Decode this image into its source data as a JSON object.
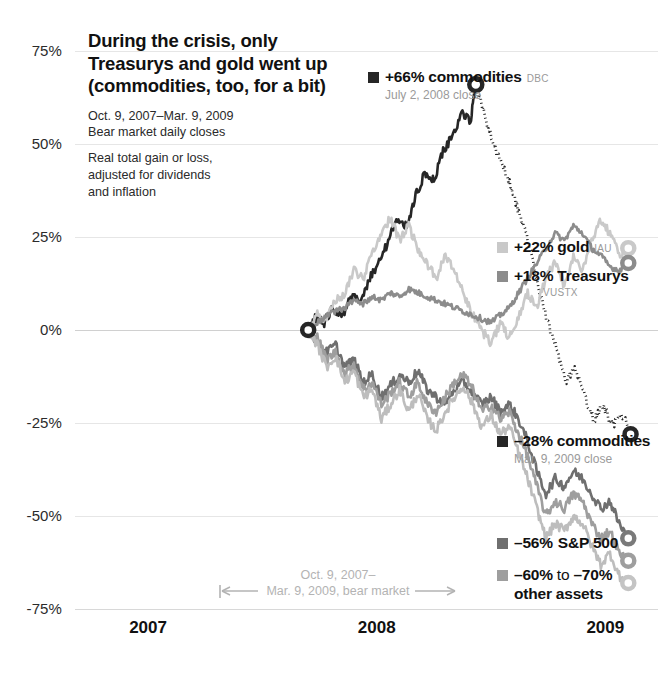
{
  "headline": {
    "title": "During the crisis, only Treasurys and gold went up (commodities, too, for a bit)",
    "subtitle_1_line_1": "Oct. 9, 2007–Mar. 9, 2009",
    "subtitle_1_line_2": "Bear market daily closes",
    "subtitle_2_line_1": "Real total gain or loss,",
    "subtitle_2_line_2": "adjusted for dividends",
    "subtitle_2_line_3": "and inflation"
  },
  "annotations": {
    "commodities_peak": {
      "value": "+66%",
      "name": "commodities",
      "ticker": "DBC",
      "note": "July 2, 2008 close",
      "color": "#262626"
    },
    "gold": {
      "value": "+22%",
      "name": "gold",
      "ticker": "IAU",
      "color": "#c9c9c9"
    },
    "treasurys": {
      "value": "+18%",
      "name": "Treasurys",
      "ticker": "VUSTX",
      "color": "#8c8c8c"
    },
    "commodities_end": {
      "value": "–28%",
      "name": "commodities",
      "note": "Mar. 9, 2009 close",
      "color": "#262626"
    },
    "sp500": {
      "value": "–56%",
      "name": "S&P 500",
      "color": "#6f6f6f"
    },
    "other_assets": {
      "value": "–60%",
      "connector": "to",
      "value2": "–70%",
      "name": "other assets",
      "color": "#9e9e9e"
    },
    "bear_market": {
      "line1": "Oct. 9, 2007–",
      "line2": "Mar. 9, 2009, bear market",
      "color": "#b3b3b3"
    }
  },
  "chart_data": {
    "type": "line",
    "title": "During the crisis, only Treasurys and gold went up (commodities, too, for a bit)",
    "subtitle": "Oct. 9, 2007–Mar. 9, 2009 Bear market daily closes. Real total gain or loss, adjusted for dividends and inflation",
    "xlabel": "",
    "ylabel": "",
    "ylim": [
      -75,
      75
    ],
    "yticks": [
      75,
      50,
      25,
      0,
      -25,
      -50,
      -75
    ],
    "ytick_labels": [
      "75%",
      "50%",
      "25%",
      "0%",
      "-25%",
      "-50%",
      "-75%"
    ],
    "xlim": [
      2006.75,
      2009.3
    ],
    "xticks": [
      2007,
      2008,
      2009
    ],
    "xtick_labels": [
      "2007",
      "2008",
      "2009"
    ],
    "grid": true,
    "legend_position": "right-inline",
    "bear_market_start": "2007-10-09",
    "bear_market_end": "2009-03-09",
    "series": [
      {
        "name": "commodities",
        "ticker": "DBC",
        "color": "#262626",
        "style": "solid-then-dotted",
        "dotted_from_x": 2008.503,
        "start_value": 0,
        "peak_value": 66,
        "peak_date": "2008-07-02",
        "end_value": -28,
        "x": [
          2007.77,
          2007.8,
          2007.84,
          2007.88,
          2007.92,
          2007.96,
          2008.0,
          2008.04,
          2008.08,
          2008.12,
          2008.16,
          2008.2,
          2008.24,
          2008.28,
          2008.32,
          2008.36,
          2008.4,
          2008.44,
          2008.48,
          2008.503,
          2008.54,
          2008.58,
          2008.62,
          2008.66,
          2008.7,
          2008.74,
          2008.78,
          2008.82,
          2008.86,
          2008.9,
          2008.94,
          2008.98,
          2009.02,
          2009.06,
          2009.1,
          2009.14,
          2009.18
        ],
        "values": [
          0,
          3,
          2,
          6,
          4,
          9,
          8,
          14,
          18,
          24,
          30,
          28,
          36,
          42,
          40,
          48,
          52,
          58,
          56,
          66,
          58,
          50,
          44,
          38,
          30,
          22,
          10,
          2,
          -6,
          -14,
          -10,
          -18,
          -24,
          -20,
          -26,
          -22,
          -28
        ]
      },
      {
        "name": "gold",
        "ticker": "IAU",
        "color": "#c9c9c9",
        "style": "solid",
        "start_value": 0,
        "end_value": 22,
        "x": [
          2007.77,
          2007.81,
          2007.85,
          2007.89,
          2007.93,
          2007.97,
          2008.01,
          2008.05,
          2008.09,
          2008.13,
          2008.17,
          2008.21,
          2008.25,
          2008.29,
          2008.33,
          2008.37,
          2008.41,
          2008.45,
          2008.49,
          2008.53,
          2008.57,
          2008.61,
          2008.65,
          2008.69,
          2008.73,
          2008.77,
          2008.81,
          2008.85,
          2008.89,
          2008.93,
          2008.97,
          2009.01,
          2009.05,
          2009.09,
          2009.13,
          2009.17
        ],
        "values": [
          0,
          4,
          3,
          8,
          10,
          16,
          14,
          20,
          26,
          30,
          24,
          28,
          22,
          18,
          14,
          20,
          16,
          10,
          4,
          0,
          -4,
          2,
          -2,
          4,
          10,
          6,
          14,
          18,
          12,
          20,
          16,
          24,
          30,
          26,
          20,
          22
        ]
      },
      {
        "name": "Treasurys",
        "ticker": "VUSTX",
        "color": "#8c8c8c",
        "style": "solid",
        "start_value": 0,
        "end_value": 18,
        "x": [
          2007.77,
          2007.81,
          2007.85,
          2007.89,
          2007.93,
          2007.97,
          2008.01,
          2008.05,
          2008.09,
          2008.13,
          2008.17,
          2008.21,
          2008.25,
          2008.29,
          2008.33,
          2008.37,
          2008.41,
          2008.45,
          2008.49,
          2008.53,
          2008.57,
          2008.61,
          2008.65,
          2008.69,
          2008.73,
          2008.77,
          2008.81,
          2008.85,
          2008.89,
          2008.93,
          2008.97,
          2009.01,
          2009.05,
          2009.09,
          2009.13,
          2009.17
        ],
        "values": [
          0,
          2,
          4,
          5,
          6,
          8,
          7,
          9,
          8,
          10,
          9,
          11,
          10,
          9,
          8,
          7,
          6,
          5,
          4,
          3,
          2,
          4,
          6,
          10,
          14,
          18,
          22,
          26,
          24,
          28,
          26,
          22,
          20,
          17,
          16,
          18
        ]
      },
      {
        "name": "S&P 500",
        "color": "#6f6f6f",
        "style": "solid",
        "start_value": 0,
        "end_value": -56,
        "x": [
          2007.77,
          2007.81,
          2007.85,
          2007.89,
          2007.93,
          2007.97,
          2008.01,
          2008.05,
          2008.09,
          2008.13,
          2008.17,
          2008.21,
          2008.25,
          2008.29,
          2008.33,
          2008.37,
          2008.41,
          2008.45,
          2008.49,
          2008.53,
          2008.57,
          2008.61,
          2008.65,
          2008.69,
          2008.73,
          2008.77,
          2008.81,
          2008.85,
          2008.89,
          2008.93,
          2008.97,
          2009.01,
          2009.05,
          2009.09,
          2009.13,
          2009.17
        ],
        "values": [
          0,
          -3,
          -6,
          -4,
          -10,
          -8,
          -14,
          -12,
          -18,
          -15,
          -12,
          -14,
          -11,
          -16,
          -18,
          -20,
          -16,
          -14,
          -17,
          -20,
          -18,
          -22,
          -20,
          -24,
          -30,
          -38,
          -44,
          -40,
          -42,
          -38,
          -40,
          -44,
          -48,
          -46,
          -52,
          -56
        ]
      },
      {
        "name": "other assets",
        "color": "#9e9e9e",
        "style": "solid",
        "start_value": 0,
        "end_value": -62,
        "x": [
          2007.77,
          2007.81,
          2007.85,
          2007.89,
          2007.93,
          2007.97,
          2008.01,
          2008.05,
          2008.09,
          2008.13,
          2008.17,
          2008.21,
          2008.25,
          2008.29,
          2008.33,
          2008.37,
          2008.41,
          2008.45,
          2008.49,
          2008.53,
          2008.57,
          2008.61,
          2008.65,
          2008.69,
          2008.73,
          2008.77,
          2008.81,
          2008.85,
          2008.89,
          2008.93,
          2008.97,
          2009.01,
          2009.05,
          2009.09,
          2009.13,
          2009.17
        ],
        "values": [
          0,
          -2,
          -8,
          -6,
          -12,
          -9,
          -16,
          -14,
          -20,
          -17,
          -14,
          -18,
          -14,
          -20,
          -22,
          -18,
          -14,
          -12,
          -16,
          -22,
          -20,
          -24,
          -22,
          -28,
          -34,
          -42,
          -50,
          -46,
          -48,
          -44,
          -46,
          -52,
          -56,
          -54,
          -60,
          -62
        ]
      },
      {
        "name": "other assets 2",
        "color": "#bdbdbd",
        "style": "solid",
        "start_value": 0,
        "end_value": -68,
        "x": [
          2007.77,
          2007.81,
          2007.85,
          2007.89,
          2007.93,
          2007.97,
          2008.01,
          2008.05,
          2008.09,
          2008.13,
          2008.17,
          2008.21,
          2008.25,
          2008.29,
          2008.33,
          2008.37,
          2008.41,
          2008.45,
          2008.49,
          2008.53,
          2008.57,
          2008.61,
          2008.65,
          2008.69,
          2008.73,
          2008.77,
          2008.81,
          2008.85,
          2008.89,
          2008.93,
          2008.97,
          2009.01,
          2009.05,
          2009.09,
          2009.13,
          2009.17
        ],
        "values": [
          0,
          -4,
          -10,
          -7,
          -14,
          -11,
          -18,
          -16,
          -24,
          -20,
          -16,
          -22,
          -17,
          -24,
          -27,
          -22,
          -18,
          -15,
          -20,
          -26,
          -23,
          -28,
          -26,
          -33,
          -40,
          -48,
          -56,
          -52,
          -54,
          -50,
          -52,
          -58,
          -63,
          -60,
          -66,
          -68
        ]
      }
    ],
    "markers": [
      {
        "name": "start",
        "x": 2007.77,
        "y": 0,
        "color": "#262626",
        "size": 12
      },
      {
        "name": "commodities-peak",
        "x": 2008.503,
        "y": 66,
        "color": "#262626",
        "size": 13
      },
      {
        "name": "commodities-end",
        "x": 2009.18,
        "y": -28,
        "color": "#262626",
        "size": 12
      },
      {
        "name": "gold-end",
        "x": 2009.17,
        "y": 22,
        "color": "#c9c9c9",
        "size": 12
      },
      {
        "name": "treasurys-end",
        "x": 2009.17,
        "y": 18,
        "color": "#8c8c8c",
        "size": 12
      },
      {
        "name": "sp500-end",
        "x": 2009.17,
        "y": -56,
        "color": "#7a7a7a",
        "size": 12
      },
      {
        "name": "other-end-1",
        "x": 2009.17,
        "y": -62,
        "color": "#9e9e9e",
        "size": 12
      },
      {
        "name": "other-end-2",
        "x": 2009.17,
        "y": -68,
        "color": "#c4c4c4",
        "size": 12
      }
    ]
  }
}
